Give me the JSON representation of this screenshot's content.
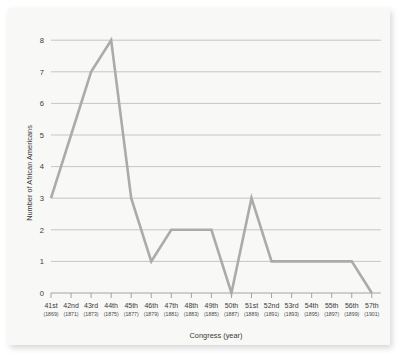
{
  "figure": {
    "background_color": "#f8f8f6",
    "line_color": "#ababab",
    "grid_color": "#b9b9b9",
    "axis_color": "#9a9a9a"
  },
  "chart_data": {
    "type": "line",
    "title": "",
    "xlabel": "Congress (year)",
    "ylabel": "Number of African Americans",
    "categories": [
      "41st",
      "42nd",
      "43rd",
      "44th",
      "45th",
      "46th",
      "47th",
      "48th",
      "49th",
      "50th",
      "51st",
      "52nd",
      "53rd",
      "54th",
      "55th",
      "56th",
      "57th"
    ],
    "category_years": [
      "(1869)",
      "(1871)",
      "(1873)",
      "(1875)",
      "(1877)",
      "(1879)",
      "(1881)",
      "(1883)",
      "(1885)",
      "(1887)",
      "(1889)",
      "(1891)",
      "(1893)",
      "(1895)",
      "(1897)",
      "(1899)",
      "(1901)"
    ],
    "values": [
      3,
      5,
      7,
      8,
      3,
      1,
      2,
      2,
      2,
      0,
      3,
      1,
      1,
      1,
      1,
      1,
      0
    ],
    "ylim": [
      0,
      8
    ],
    "yticks": [
      0,
      1,
      2,
      3,
      4,
      5,
      6,
      7,
      8
    ],
    "ytick_labels": [
      "0",
      "1",
      "2",
      "3",
      "4",
      "5",
      "6",
      "7",
      "8"
    ],
    "grid": true,
    "grid_axis": "y",
    "legend": false,
    "legend_position": "none"
  }
}
